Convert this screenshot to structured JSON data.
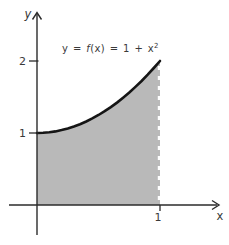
{
  "figure": {
    "background_color": "#ffffff",
    "equation": {
      "before_f": "y = ",
      "f": "f",
      "after_f": "(x) = 1 + x",
      "exponent": "2"
    }
  },
  "chart_data": {
    "type": "area",
    "function": "f(x) = 1 + x^2",
    "xlabel": "x",
    "ylabel": "y",
    "x": [
      0,
      0.05,
      0.1,
      0.15,
      0.2,
      0.25,
      0.3,
      0.35,
      0.4,
      0.45,
      0.5,
      0.55,
      0.6,
      0.65,
      0.7,
      0.75,
      0.8,
      0.85,
      0.9,
      0.95,
      1
    ],
    "y": [
      1,
      1.0025,
      1.01,
      1.0225,
      1.04,
      1.0625,
      1.09,
      1.1225,
      1.16,
      1.2025,
      1.25,
      1.3025,
      1.36,
      1.4225,
      1.49,
      1.5625,
      1.64,
      1.7225,
      1.81,
      1.9025,
      2
    ],
    "x_ticks": [
      {
        "value": 1,
        "label": "1"
      }
    ],
    "y_ticks": [
      {
        "value": 1,
        "label": "1"
      },
      {
        "value": 2,
        "label": "2"
      }
    ],
    "xlim": [
      0,
      1.48
    ],
    "ylim": [
      0,
      2.7
    ],
    "shaded_region": {
      "from_x": 0,
      "to_x": 1
    },
    "dashed_boundary_x": 1,
    "grid": false,
    "colors": {
      "fill": "#b9b9b9",
      "curve": "#151515",
      "axis": "#2b2b2b",
      "text": "#3a3a3a",
      "dash": "#ffffff"
    }
  }
}
